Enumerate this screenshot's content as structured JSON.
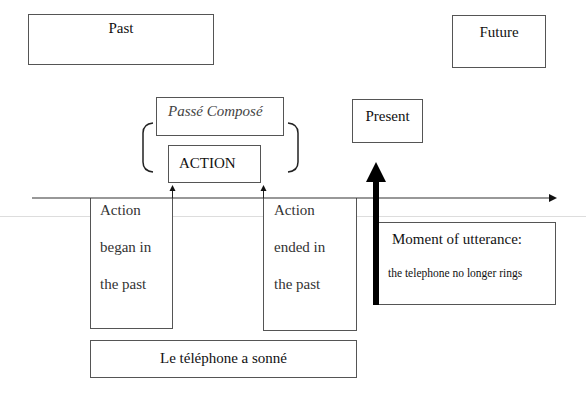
{
  "diagram": {
    "labels": {
      "past": "Past",
      "future": "Future",
      "present": "Present",
      "passe_compose": "Passé Composé",
      "action": "ACTION",
      "began": [
        "Action",
        "began in",
        "the past"
      ],
      "ended": [
        "Action",
        "ended in",
        "the past"
      ],
      "example": "Le téléphone a sonné",
      "moment_title": "Moment of utterance:",
      "moment_desc": "the telephone no longer rings"
    },
    "colors": {
      "line": "#333333",
      "box_border": "#555555",
      "background": "#ffffff"
    }
  }
}
